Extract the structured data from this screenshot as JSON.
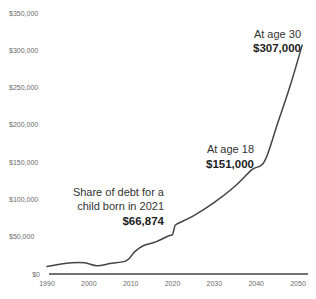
{
  "chart_data": {
    "type": "line",
    "title": "",
    "xlabel": "",
    "ylabel": "",
    "xlim": [
      1990,
      2051
    ],
    "ylim": [
      0,
      350000
    ],
    "grid": false,
    "legend": null,
    "x_ticks": [
      1990,
      2000,
      2010,
      2020,
      2030,
      2040,
      2050
    ],
    "x_tick_labels": [
      "1990",
      "2000",
      "2010",
      "2020",
      "2030",
      "2040",
      "2050"
    ],
    "y_ticks": [
      0,
      50000,
      100000,
      150000,
      200000,
      250000,
      300000,
      350000
    ],
    "y_tick_labels": [
      "$0",
      "$50,000",
      "$100,000",
      "$150,000",
      "$200,000",
      "$250,000",
      "$300,000",
      "$350,000"
    ],
    "series": [
      {
        "name": "Share of debt per child",
        "color": "#444444",
        "x": [
          1990,
          1993,
          1996,
          1999,
          2002,
          2005,
          2009,
          2011,
          2013,
          2016,
          2019,
          2020,
          2020.5,
          2021,
          2025,
          2030,
          2035,
          2039,
          2042,
          2045,
          2048,
          2051
        ],
        "values": [
          10000,
          13000,
          15000,
          15000,
          11000,
          14000,
          18000,
          30000,
          38000,
          43000,
          51000,
          53000,
          63000,
          66874,
          78000,
          96000,
          118000,
          140000,
          151000,
          200000,
          250000,
          307000
        ]
      }
    ],
    "annotations": [
      {
        "lines": [
          "Share of debt for a",
          "child born in 2021"
        ],
        "value": "$66,874",
        "year": 2021
      },
      {
        "lines": [
          "At age 18"
        ],
        "value": "$151,000",
        "year": 2039
      },
      {
        "lines": [
          "At age 30"
        ],
        "value": "$307,000",
        "year": 2051
      }
    ]
  }
}
